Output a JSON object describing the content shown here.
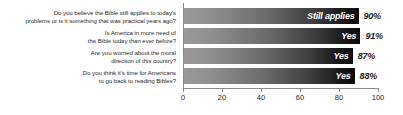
{
  "chart_data": {
    "type": "bar",
    "orientation": "horizontal",
    "title": "",
    "subtitle": "",
    "xlabel": "",
    "ylabel": "",
    "xlim": [
      0,
      100
    ],
    "xticks": [
      0,
      20,
      40,
      60,
      80,
      100
    ],
    "xtick_labels": [
      "0",
      "20",
      "40",
      "60",
      "80",
      "100"
    ],
    "grid": false,
    "legend": "none",
    "categories": [
      "Do you believe the Bible still applies to today's problems or is it something that was practical years ago?",
      "Is America in more need of the Bible today than ever before?",
      "Are you worried about the moral direction of this country?",
      "Do you think it's time for Americans to go back to reading Bibles?"
    ],
    "values": [
      90,
      91,
      87,
      88
    ],
    "bar_labels": [
      "Still applies",
      "Yes",
      "Yes",
      "Yes"
    ],
    "value_labels": [
      "90%",
      "91%",
      "87%",
      "88%"
    ],
    "bar_gradient_start": "#9a9a9a",
    "bar_gradient_end": "#0a0a0a",
    "axis_color": "#8a8a8a",
    "text_color": "#2b2b2b",
    "value_text_color": "#1a1a1a",
    "bar_label_text_color": "#ffffff",
    "background": "#ffffff"
  },
  "questions": [
    {
      "line1": "Do you believe the Bible still applies to today's",
      "line2": "problems or is it something that was practical years ago?"
    },
    {
      "line1": "Is America in more need of",
      "line2": "the Bible today than ever before?"
    },
    {
      "line1": "Are you worried about the moral",
      "line2": "direction of this country?"
    },
    {
      "line1": "Do you think it's time for Americans",
      "line2": "to go back to reading Bibles?"
    }
  ]
}
